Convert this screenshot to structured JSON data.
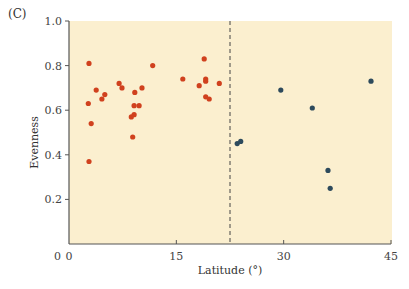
{
  "panel_label": "(C)",
  "colors": {
    "plot_background": "#fbefcf",
    "axis": "#555555",
    "tropical": "#d0411e",
    "extratropical": "#2d4a5c",
    "divider": "#444444"
  },
  "chart_data": {
    "type": "scatter",
    "title": "",
    "xlabel": "Latitude (°)",
    "ylabel": "Evenness",
    "xlim": [
      0,
      45
    ],
    "ylim": [
      0,
      1.0
    ],
    "xticks": [
      0,
      15,
      30,
      45
    ],
    "xtick_labels": [
      "0",
      "15",
      "30",
      "45"
    ],
    "yticks": [
      0,
      0.2,
      0.4,
      0.6,
      0.8,
      1.0
    ],
    "ytick_labels": [
      "0",
      "0.2",
      "0.4",
      "0.6",
      "0.8",
      "1.0"
    ],
    "grid": false,
    "legend": null,
    "reference_line": {
      "orientation": "vertical",
      "x": 22.5,
      "style": "dashed"
    },
    "series": [
      {
        "name": "tropical",
        "color": "#d0411e",
        "points": [
          [
            2.8,
            0.81
          ],
          [
            2.7,
            0.63
          ],
          [
            3.1,
            0.54
          ],
          [
            2.8,
            0.37
          ],
          [
            3.8,
            0.69
          ],
          [
            5.0,
            0.67
          ],
          [
            4.6,
            0.65
          ],
          [
            7.0,
            0.72
          ],
          [
            7.4,
            0.7
          ],
          [
            9.2,
            0.68
          ],
          [
            10.2,
            0.7
          ],
          [
            9.1,
            0.62
          ],
          [
            9.8,
            0.62
          ],
          [
            9.1,
            0.58
          ],
          [
            8.7,
            0.57
          ],
          [
            8.9,
            0.48
          ],
          [
            11.7,
            0.8
          ],
          [
            15.9,
            0.74
          ],
          [
            18.9,
            0.83
          ],
          [
            18.2,
            0.71
          ],
          [
            19.1,
            0.74
          ],
          [
            19.1,
            0.73
          ],
          [
            21.0,
            0.72
          ],
          [
            19.1,
            0.66
          ],
          [
            19.6,
            0.65
          ]
        ]
      },
      {
        "name": "extratropical",
        "color": "#2d4a5c",
        "points": [
          [
            23.5,
            0.45
          ],
          [
            24.0,
            0.46
          ],
          [
            29.6,
            0.69
          ],
          [
            34.0,
            0.61
          ],
          [
            36.2,
            0.33
          ],
          [
            36.5,
            0.25
          ],
          [
            42.2,
            0.73
          ]
        ]
      }
    ]
  }
}
